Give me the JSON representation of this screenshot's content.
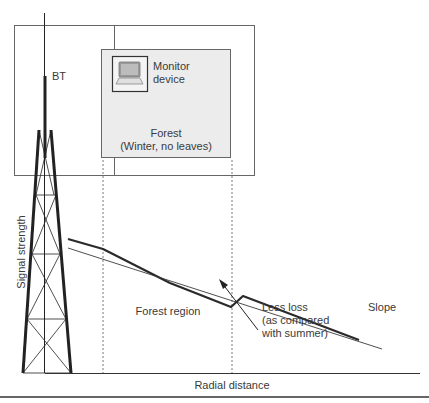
{
  "diagram": {
    "tower_label": "BT",
    "monitor_device": {
      "icon": "laptop-icon",
      "line1": "Monitor",
      "line2": "device"
    },
    "forest_box": {
      "line1": "Forest",
      "line2": "(Winter, no leaves)"
    },
    "axes": {
      "y_label": "Signal strength",
      "x_label": "Radial distance"
    },
    "region_label": "Forest region",
    "annotation": {
      "line1": "Less loss",
      "line2": "(as compared",
      "line3": "with summer)"
    },
    "slope_label": "Slope",
    "series": [
      {
        "name": "winter-signal",
        "style": "thick",
        "description": "Measured signal with reduced forest loss and recovery step after forest"
      },
      {
        "name": "reference-slope",
        "style": "thin",
        "description": "Reference propagation slope"
      }
    ],
    "colors": {
      "line": "#2a2a2a",
      "forest_fill": "#ececec",
      "box_stroke": "#555555"
    }
  }
}
